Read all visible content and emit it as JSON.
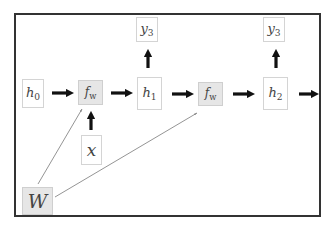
{
  "diagram": {
    "type": "recurrent-neural-network-computational-graph",
    "nodes": [
      {
        "id": "h0",
        "label": "h",
        "sub": "0",
        "shaded": false
      },
      {
        "id": "fw1",
        "label": "f",
        "sub": "w",
        "shaded": true
      },
      {
        "id": "h1",
        "label": "h",
        "sub": "1",
        "shaded": false
      },
      {
        "id": "fw2",
        "label": "f",
        "sub": "w",
        "shaded": true
      },
      {
        "id": "h2",
        "label": "h",
        "sub": "2",
        "shaded": false
      },
      {
        "id": "y3a",
        "label": "y",
        "sub": "3",
        "shaded": false
      },
      {
        "id": "y3b",
        "label": "y",
        "sub": "3",
        "shaded": false
      },
      {
        "id": "x",
        "label": "x",
        "sub": "",
        "shaded": false
      },
      {
        "id": "W",
        "label": "W",
        "sub": "",
        "shaded": true
      }
    ],
    "edges": [
      {
        "from": "h0",
        "to": "fw1",
        "style": "thick"
      },
      {
        "from": "fw1",
        "to": "h1",
        "style": "thick"
      },
      {
        "from": "h1",
        "to": "fw2",
        "style": "thick"
      },
      {
        "from": "fw2",
        "to": "h2",
        "style": "thick"
      },
      {
        "from": "h2",
        "to": "next",
        "style": "thick"
      },
      {
        "from": "h1",
        "to": "y3a",
        "style": "thick"
      },
      {
        "from": "h2",
        "to": "y3b",
        "style": "thick"
      },
      {
        "from": "x",
        "to": "fw1",
        "style": "thick"
      },
      {
        "from": "W",
        "to": "fw1",
        "style": "thin"
      },
      {
        "from": "W",
        "to": "fw2",
        "style": "thin"
      }
    ],
    "colors": {
      "frame": "#333333",
      "node_border": "#d4d4d4",
      "shaded_fill": "#e6e6e6",
      "arrow": "#111111",
      "thin_line": "#888888"
    }
  }
}
